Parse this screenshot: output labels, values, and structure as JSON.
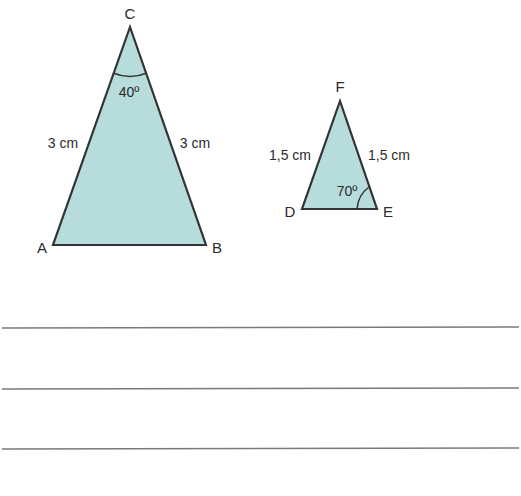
{
  "colors": {
    "fill": "#b6dcdc",
    "stroke": "#333333",
    "answer_line": "#7a7a7a",
    "text": "#2b2b2b"
  },
  "triangle_abc": {
    "vertices": {
      "a": "A",
      "b": "B",
      "c": "C"
    },
    "sides": {
      "ac": "3 cm",
      "bc": "3 cm"
    },
    "angle_c": "40º"
  },
  "triangle_def": {
    "vertices": {
      "d": "D",
      "e": "E",
      "f": "F"
    },
    "sides": {
      "df": "1,5 cm",
      "ef": "1,5 cm"
    },
    "angle_e": "70º"
  },
  "answer_lines": {
    "count": 3
  }
}
